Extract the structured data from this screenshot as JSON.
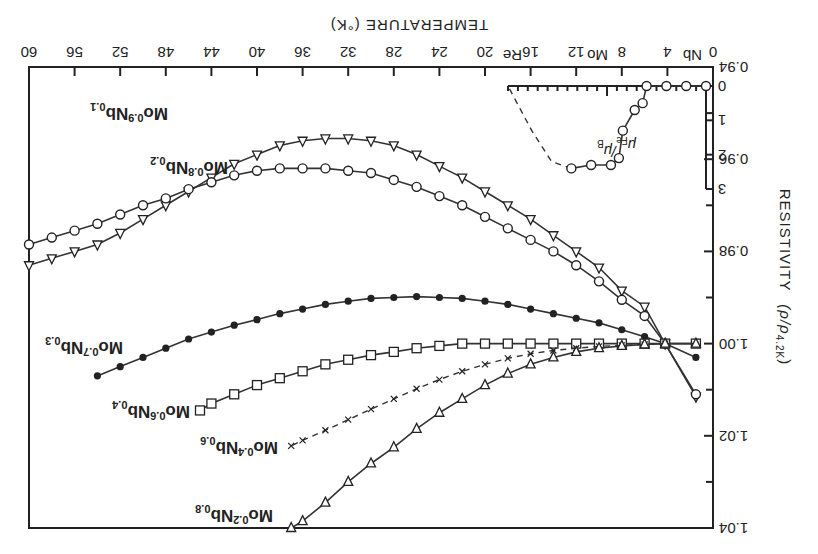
{
  "chart_data": {
    "type": "line",
    "orientation_note": "figure rendered rotated 180 degrees",
    "title": "",
    "xlabel": "TEMPERATURE (°K)",
    "ylabel": "RESISTIVITY (ρ/ρ4.2K)",
    "xlim": [
      0,
      60
    ],
    "ylim": [
      0.94,
      1.04
    ],
    "y_inverted": true,
    "x_ticks": [
      "0",
      "4",
      "8",
      "12",
      "16",
      "20",
      "24",
      "28",
      "32",
      "36",
      "40",
      "44",
      "48",
      "52",
      "56",
      "60"
    ],
    "y_ticks": [
      "0.94",
      "0.96",
      "0.98",
      "1.00",
      "1.02",
      "1.04"
    ],
    "grid": false,
    "series": [
      {
        "name": "Mo0.9Nb0.1",
        "marker": "open-triangle-up",
        "x": [
          1.5,
          4.2,
          6,
          8,
          10,
          12,
          14,
          16,
          18,
          20,
          22,
          24,
          26,
          28,
          30,
          32,
          34,
          36,
          38,
          40,
          42,
          44,
          46,
          48,
          50,
          52,
          54,
          56,
          58,
          60
        ],
        "y": [
          1.0115,
          1.0,
          0.992,
          0.9885,
          0.9835,
          0.98,
          0.9765,
          0.973,
          0.97,
          0.967,
          0.964,
          0.9615,
          0.959,
          0.957,
          0.956,
          0.9555,
          0.9555,
          0.956,
          0.957,
          0.959,
          0.961,
          0.964,
          0.967,
          0.97,
          0.973,
          0.976,
          0.9785,
          0.98,
          0.9815,
          0.983
        ]
      },
      {
        "name": "Mo0.8Nb0.2",
        "marker": "open-circle",
        "x": [
          1.5,
          4.2,
          6,
          8,
          10,
          12,
          14,
          16,
          18,
          20,
          22,
          24,
          26,
          28,
          30,
          32,
          34,
          36,
          38,
          40,
          42,
          44,
          46,
          48,
          50,
          52,
          54,
          56,
          58,
          60
        ],
        "y": [
          1.011,
          1.0,
          0.994,
          0.9905,
          0.9865,
          0.983,
          0.98,
          0.9775,
          0.975,
          0.9725,
          0.97,
          0.968,
          0.966,
          0.9645,
          0.963,
          0.9625,
          0.962,
          0.962,
          0.962,
          0.9625,
          0.9635,
          0.965,
          0.9665,
          0.9685,
          0.97,
          0.972,
          0.974,
          0.9755,
          0.977,
          0.9785
        ]
      },
      {
        "name": "Mo0.7Nb0.3",
        "marker": "filled-circle",
        "x": [
          1.5,
          4.2,
          6,
          8,
          10,
          12,
          14,
          16,
          18,
          20,
          22,
          24,
          26,
          28,
          30,
          32,
          34,
          36,
          38,
          40,
          42,
          44,
          46,
          48,
          50,
          52,
          54
        ],
        "y": [
          1.003,
          1.0,
          0.9985,
          0.997,
          0.9955,
          0.9945,
          0.9935,
          0.9925,
          0.9915,
          0.9908,
          0.9902,
          0.99,
          0.9898,
          0.99,
          0.9902,
          0.9908,
          0.9915,
          0.9925,
          0.9935,
          0.9948,
          0.996,
          0.9975,
          0.999,
          1.001,
          1.003,
          1.005,
          1.007
        ]
      },
      {
        "name": "Mo0.6Nb0.4",
        "marker": "open-square",
        "x": [
          1.5,
          4.2,
          6,
          8,
          10,
          12,
          14,
          16,
          18,
          20,
          22,
          24,
          26,
          28,
          30,
          32,
          34,
          36,
          38,
          40,
          42,
          44,
          45
        ],
        "y": [
          1.0,
          1.0,
          1.0,
          1.0,
          1.0,
          1.0,
          1.0,
          1.0,
          1.0,
          1.0,
          1.0,
          1.0005,
          1.001,
          1.0018,
          1.0025,
          1.0035,
          1.0045,
          1.006,
          1.0075,
          1.009,
          1.011,
          1.013,
          1.0145
        ]
      },
      {
        "name": "Mo0.4Nb0.6",
        "marker": "cross",
        "x": [
          4.2,
          6,
          8,
          10,
          12,
          14,
          16,
          18,
          20,
          22,
          24,
          26,
          28,
          30,
          32,
          34,
          36,
          37
        ],
        "y": [
          1.0,
          1.0002,
          1.0004,
          1.0006,
          1.001,
          1.0015,
          1.0022,
          1.0032,
          1.0045,
          1.006,
          1.0078,
          1.0098,
          1.012,
          1.0142,
          1.0165,
          1.0188,
          1.021,
          1.0222
        ]
      },
      {
        "name": "Mo0.2Nb0.8",
        "marker": "open-triangle-down",
        "x": [
          1.5,
          4.2,
          6,
          8,
          10,
          12,
          14,
          16,
          18,
          20,
          22,
          24,
          26,
          28,
          30,
          32,
          34,
          36,
          37
        ],
        "y": [
          1.0,
          1.0,
          1.0002,
          1.0005,
          1.001,
          1.0018,
          1.003,
          1.0045,
          1.0065,
          1.009,
          1.012,
          1.015,
          1.0185,
          1.0225,
          1.026,
          1.03,
          1.0345,
          1.0385,
          1.04
        ]
      }
    ],
    "inset": {
      "ylabel": "μFe/μB",
      "y_ticks": [
        "0",
        "1",
        "2",
        "3"
      ],
      "x_labels": [
        "Nb",
        "Mo",
        "Re"
      ],
      "series_solid": {
        "x": [
          0,
          0.1,
          0.2,
          0.3,
          0.32,
          0.36,
          0.42,
          0.44,
          0.48,
          0.58,
          0.68
        ],
        "y": [
          0,
          0,
          0,
          0,
          0.5,
          0.7,
          1.3,
          2.1,
          2.3,
          2.3,
          2.4
        ]
      },
      "series_dashed": {
        "x": [
          0.68,
          0.78,
          0.88,
          1.0
        ],
        "y": [
          2.4,
          2.2,
          1.3,
          0
        ]
      }
    }
  },
  "labels": {
    "x_axis": "TEMPERATURE",
    "x_unit": "(°K)",
    "y_axis": "RESISTIVITY",
    "y_unit_rho": "(ρ/ρ",
    "y_unit_sub": "4.2K",
    "y_unit_close": ")",
    "inset_ylabel_main": "μ",
    "inset_ylabel_sub": "Fe",
    "inset_ylabel_tail": "/μ",
    "inset_ylabel_tail_sub": "B",
    "inset_nb": "Nb",
    "inset_mo": "Mo",
    "inset_re": "Re"
  },
  "series_labels": [
    {
      "a": "Mo",
      "as": "0.9",
      "b": "Nb",
      "bs": "0.1"
    },
    {
      "a": "Mo",
      "as": "0.8",
      "b": "Nb",
      "bs": "0.2"
    },
    {
      "a": "Mo",
      "as": "0.7",
      "b": "Nb",
      "bs": "0.3"
    },
    {
      "a": "Mo",
      "as": "0.6",
      "b": "Nb",
      "bs": "0.4"
    },
    {
      "a": "Mo",
      "as": "0.4",
      "b": "Nb",
      "bs": "0.6"
    },
    {
      "a": "Mo",
      "as": "0.2",
      "b": "Nb",
      "bs": "0.8"
    }
  ]
}
